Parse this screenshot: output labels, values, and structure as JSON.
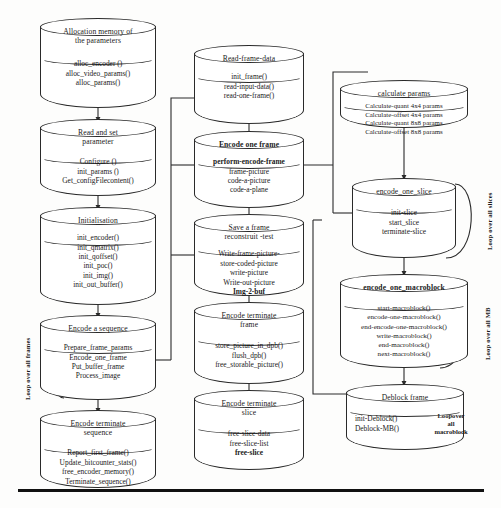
{
  "diagram": {
    "nodes": [
      {
        "id": "alloc",
        "title": "Allocation memory of\nthe parameters",
        "lines": [
          "alloc_encoder ()",
          "alloc_video_params()",
          "alloc_params()"
        ]
      },
      {
        "id": "readset",
        "title": "Read and set\nparameter",
        "lines": [
          "Configure ()",
          "init_params ()",
          "Get_configFilecontent()"
        ]
      },
      {
        "id": "init",
        "title": "Initialisation",
        "lines": [
          "init_encoder()",
          "init_qmatrix()",
          "init_qoffset()",
          "init_poc()",
          "init_img()",
          "init_out_buffer()"
        ]
      },
      {
        "id": "encseq",
        "title": "Encode a sequence",
        "lines": [
          "Prepare_frame_params",
          "Encode_one_frame",
          "Put_buffer_frame",
          "Process_image"
        ]
      },
      {
        "id": "termseq",
        "title": "Encode terminate\nsequence",
        "lines": [
          "Report_first_frame()",
          "Update_bitcounter_stats()",
          "free_encoder_memory()",
          "Terminate_sequence()"
        ]
      },
      {
        "id": "readframe",
        "title": "Read-frame-data",
        "lines": [
          "init_frame()",
          "read-input-data()",
          "read-one-frame()"
        ]
      },
      {
        "id": "encframe",
        "title": "Encode one frame",
        "title_bold": true,
        "lines": [
          "perform-encode-frame",
          "frame-picture",
          "code-a-picture",
          "code-a-plane"
        ],
        "bold_first": true
      },
      {
        "id": "saveframe",
        "title": "Save a frame\nreconstruit -test",
        "lines": [
          "Write-frame-picture-",
          "store-coded-picture",
          "write-picture",
          "Write-out-picture",
          "Img-2-buf"
        ],
        "bold_last": true
      },
      {
        "id": "termframe",
        "title": "Encode terminate\nframe",
        "lines": [
          "store_picture_in_dpb()",
          "flush_dpb()",
          "free_storable_picture()"
        ]
      },
      {
        "id": "termslice",
        "title": "Encode terminate\nslice",
        "lines": [
          "free-slice-data",
          "free-slice-list",
          "free-slice"
        ],
        "bold_last": true
      },
      {
        "id": "calcparams",
        "title": "calculate params",
        "lines": [
          "Calculate-quant 4x4 params",
          "Calculate-offset 4x4 params",
          "Calculate-quant 8x8 params",
          "Calculate-offset 8x8 params"
        ]
      },
      {
        "id": "encslice",
        "title": "encode_one_slice",
        "lines": [
          "init-slice",
          "start_slice",
          "terminate-slice"
        ]
      },
      {
        "id": "encmb",
        "title": "encode_one_macroblock",
        "title_bold": true,
        "lines": [
          "start-macroblock()",
          "encode-one-macroblock()",
          "end-encode-one-macroblock()",
          "write-macroblock()",
          "end-macroblock()",
          "next-macroblock()"
        ]
      },
      {
        "id": "deblock",
        "title": "Deblock frame",
        "lines": [
          "init-Deblock()",
          "Deblock-MB()"
        ]
      }
    ],
    "loop_labels": [
      {
        "id": "loop-frames",
        "text": "Loop over all frames"
      },
      {
        "id": "loop-slices",
        "text": "Loop over all slices"
      },
      {
        "id": "loop-mb",
        "text": "Loop over all MB"
      },
      {
        "id": "loop-macroblock",
        "text": "Loopover\nall\nmacroblock"
      }
    ],
    "colors": {
      "stroke": "#2a2a2a",
      "text": "#1a1a1a",
      "background": "#fdfdfc",
      "rule": "#111111"
    }
  }
}
